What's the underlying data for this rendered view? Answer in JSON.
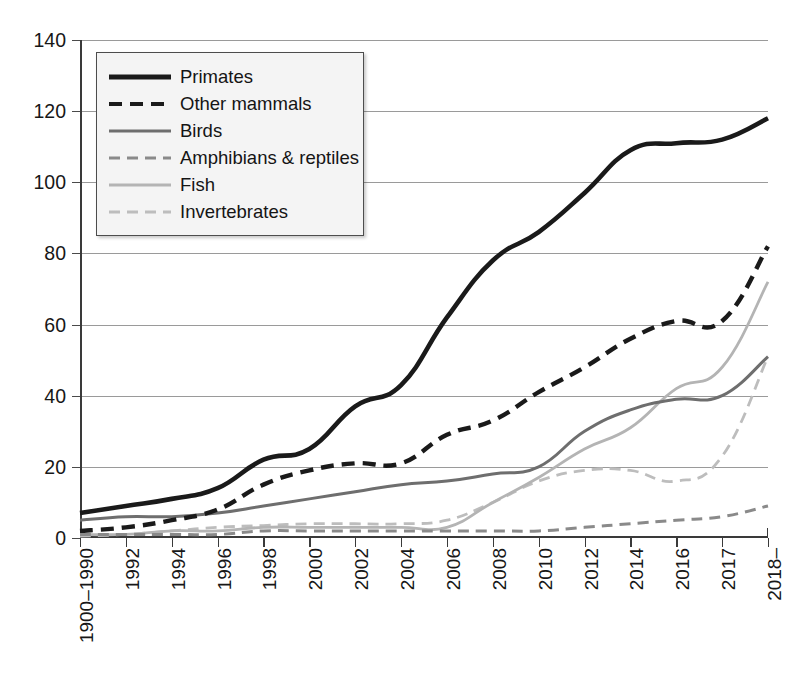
{
  "chart_data": {
    "type": "line",
    "title": "",
    "subtitle": "",
    "xlabel": "",
    "ylabel": "",
    "ylim": [
      0,
      140
    ],
    "yticks": [
      0,
      20,
      40,
      60,
      80,
      100,
      120,
      140
    ],
    "grid": true,
    "legend_position": "top-left",
    "categories": [
      "1900–1990",
      "1992",
      "1994",
      "1996",
      "1998",
      "2000",
      "2002",
      "2004",
      "2006",
      "2008",
      "2010",
      "2012",
      "2014",
      "2016",
      "2017",
      "2018–"
    ],
    "series": [
      {
        "name": "Primates",
        "style": "solid",
        "width": 4.6,
        "color": "#1a1a1a",
        "values": [
          7,
          9,
          11,
          14,
          22,
          25,
          37,
          43,
          62,
          78,
          86,
          97,
          109,
          111,
          112,
          118
        ]
      },
      {
        "name": "Other mammals",
        "style": "dashed",
        "width": 4.4,
        "color": "#1a1a1a",
        "values": [
          2,
          3,
          5,
          8,
          15,
          19,
          21,
          21,
          29,
          33,
          41,
          48,
          56,
          61,
          61,
          82
        ]
      },
      {
        "name": "Birds",
        "style": "solid",
        "width": 3.0,
        "color": "#6e6e6e",
        "values": [
          5,
          6,
          6,
          7,
          9,
          11,
          13,
          15,
          16,
          18,
          20,
          30,
          36,
          39,
          40,
          51
        ]
      },
      {
        "name": "Amphibians & reptiles",
        "style": "dashed",
        "width": 3.0,
        "color": "#8a8a8a",
        "values": [
          1,
          1,
          1,
          1,
          2,
          2,
          2,
          2,
          2,
          2,
          2,
          3,
          4,
          5,
          6,
          9
        ]
      },
      {
        "name": "Fish",
        "style": "solid",
        "width": 2.8,
        "color": "#b4b4b4",
        "values": [
          1,
          1,
          2,
          2,
          3,
          3,
          3,
          3,
          3,
          10,
          17,
          25,
          31,
          42,
          48,
          72
        ]
      },
      {
        "name": "Invertebrates",
        "style": "dashed",
        "width": 2.8,
        "color": "#bdbdbd",
        "values": [
          0.5,
          1,
          2,
          3,
          3.5,
          4,
          4,
          4,
          5,
          10,
          16,
          19,
          19,
          16,
          23,
          51
        ]
      }
    ]
  },
  "legend": {
    "items": [
      {
        "label": "Primates"
      },
      {
        "label": "Other mammals"
      },
      {
        "label": "Birds"
      },
      {
        "label": "Amphibians & reptiles"
      },
      {
        "label": "Fish"
      },
      {
        "label": "Invertebrates"
      }
    ]
  }
}
